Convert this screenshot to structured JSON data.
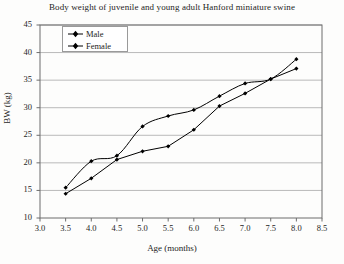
{
  "chart_data": {
    "type": "line",
    "title": "Body weight of juvenile and young adult Hanford miniature swine",
    "xlabel": "Age (months)",
    "ylabel": "BW (kg)",
    "xlim": [
      3.0,
      8.5
    ],
    "ylim": [
      10,
      45
    ],
    "xticks": [
      "3.0",
      "3.5",
      "4.0",
      "4.5",
      "5.0",
      "5.5",
      "6.0",
      "6.5",
      "7.0",
      "7.5",
      "8.0",
      "8.5"
    ],
    "yticks": [
      "10",
      "15",
      "20",
      "25",
      "30",
      "35",
      "40",
      "45"
    ],
    "grid": "horizontal",
    "legend_position": "top-left-inside",
    "x": [
      3.5,
      4.0,
      4.5,
      5.0,
      5.5,
      6.0,
      6.5,
      7.0,
      7.5,
      8.0
    ],
    "series": [
      {
        "name": "Male",
        "marker": "diamond",
        "color": "#000000",
        "values": [
          15.5,
          20.3,
          21.3,
          26.6,
          28.5,
          29.6,
          32.1,
          34.4,
          35.2,
          38.8
        ]
      },
      {
        "name": "Female",
        "marker": "triangle",
        "color": "#000000",
        "values": [
          14.4,
          17.2,
          20.6,
          22.1,
          23.0,
          26.0,
          30.3,
          32.6,
          35.2,
          37.1
        ]
      }
    ]
  },
  "legend": {
    "items": [
      {
        "label": "Male"
      },
      {
        "label": "Female"
      }
    ]
  }
}
